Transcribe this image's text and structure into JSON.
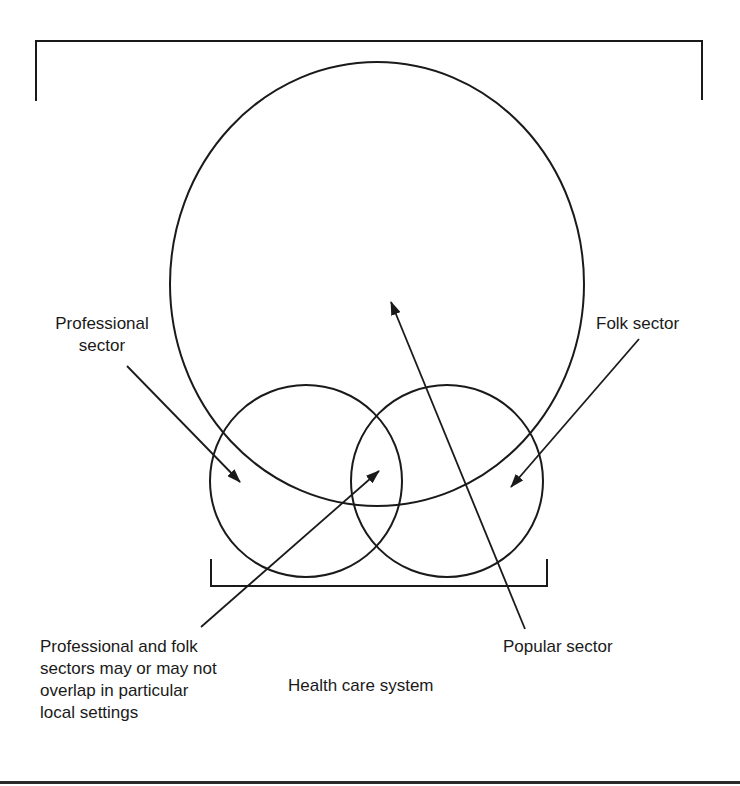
{
  "labels": {
    "professional_sector": [
      "Professional",
      "sector"
    ],
    "folk_sector": "Folk sector",
    "overlap_note": [
      "Professional and folk",
      "sectors may or may not",
      "overlap in particular",
      "local settings"
    ],
    "popular_sector": "Popular sector",
    "health_care_system": "Health care system"
  },
  "colors": {
    "stroke": "#1a1a1a",
    "background": "#ffffff"
  }
}
